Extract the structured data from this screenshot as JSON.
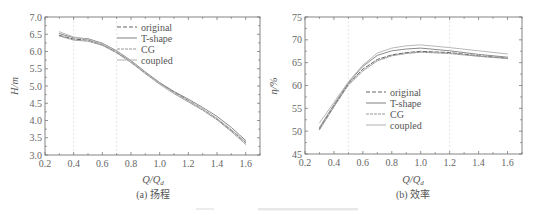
{
  "figure_caption_note": "",
  "chart_data": [
    {
      "type": "line",
      "panel_caption": "(a) 扬程",
      "xlabel": "Q/Q_d",
      "xlabel_main": "Q/Q",
      "xlabel_sub": "d",
      "ylabel": "H/m",
      "xlim": [
        0.2,
        1.7
      ],
      "ylim": [
        3.0,
        7.0
      ],
      "xticks": [
        "0.2",
        "0.4",
        "0.6",
        "0.8",
        "1.0",
        "1.2",
        "1.4",
        "1.6"
      ],
      "yticks": [
        "3.0",
        "3.5",
        "4.0",
        "4.5",
        "5.0",
        "5.5",
        "6.0",
        "6.5",
        "7.0"
      ],
      "grid": false,
      "reference_lines_x": [
        0.4,
        0.7
      ],
      "legend_position": "upper right",
      "legend": [
        "original",
        "T-shape",
        "CG",
        "coupled"
      ],
      "x": [
        0.3,
        0.4,
        0.5,
        0.6,
        0.7,
        0.8,
        0.9,
        1.0,
        1.1,
        1.2,
        1.3,
        1.4,
        1.5,
        1.6
      ],
      "series": [
        {
          "name": "original",
          "color": "#666666",
          "dash": "4 2",
          "values": [
            6.47,
            6.36,
            6.33,
            6.2,
            5.98,
            5.7,
            5.38,
            5.08,
            4.82,
            4.58,
            4.33,
            4.05,
            3.72,
            3.36
          ]
        },
        {
          "name": "T-shape",
          "color": "#8a8a8a",
          "dash": "",
          "values": [
            6.52,
            6.4,
            6.37,
            6.24,
            6.02,
            5.74,
            5.41,
            5.1,
            4.84,
            4.62,
            4.38,
            4.12,
            3.8,
            3.42
          ]
        },
        {
          "name": "CG",
          "color": "#9a9a9a",
          "dash": "3 1",
          "values": [
            6.45,
            6.33,
            6.3,
            6.18,
            5.96,
            5.68,
            5.36,
            5.05,
            4.78,
            4.54,
            4.3,
            4.02,
            3.68,
            3.31
          ]
        },
        {
          "name": "coupled",
          "color": "#b8b8b8",
          "dash": "",
          "values": [
            6.57,
            6.42,
            6.35,
            6.22,
            6.0,
            5.72,
            5.39,
            5.07,
            4.8,
            4.56,
            4.33,
            4.06,
            3.74,
            3.38
          ]
        }
      ]
    },
    {
      "type": "line",
      "panel_caption": "(b) 效率",
      "xlabel": "Q/Q_d",
      "xlabel_main": "Q/Q",
      "xlabel_sub": "d",
      "ylabel": "η/%",
      "xlim": [
        0.2,
        1.7
      ],
      "ylim": [
        45,
        75
      ],
      "xticks": [
        "0.2",
        "0.4",
        "0.6",
        "0.8",
        "1.0",
        "1.2",
        "1.4",
        "1.6"
      ],
      "yticks": [
        "45",
        "50",
        "55",
        "60",
        "65",
        "70",
        "75"
      ],
      "grid": false,
      "reference_lines_x": [
        0.5,
        1.2
      ],
      "legend_position": "center",
      "legend": [
        "original",
        "T-shape",
        "CG",
        "coupled"
      ],
      "x": [
        0.3,
        0.4,
        0.5,
        0.6,
        0.7,
        0.8,
        0.9,
        1.0,
        1.2,
        1.4,
        1.6
      ],
      "series": [
        {
          "name": "original",
          "color": "#666666",
          "dash": "4 2",
          "values": [
            50.5,
            55.5,
            60.3,
            63.6,
            65.7,
            66.7,
            67.2,
            67.5,
            67.2,
            66.5,
            66.0
          ]
        },
        {
          "name": "T-shape",
          "color": "#8a8a8a",
          "dash": "",
          "values": [
            50.8,
            55.8,
            60.6,
            64.2,
            66.6,
            67.6,
            68.0,
            68.2,
            67.6,
            66.8,
            66.2
          ]
        },
        {
          "name": "CG",
          "color": "#9a9a9a",
          "dash": "3 1",
          "values": [
            50.3,
            55.3,
            60.1,
            63.2,
            65.4,
            66.5,
            67.0,
            67.3,
            67.0,
            66.4,
            65.9
          ]
        },
        {
          "name": "coupled",
          "color": "#b8b8b8",
          "dash": "",
          "values": [
            51.8,
            56.3,
            60.8,
            64.5,
            67.1,
            68.2,
            68.7,
            68.9,
            68.3,
            67.6,
            66.9
          ]
        }
      ]
    }
  ]
}
